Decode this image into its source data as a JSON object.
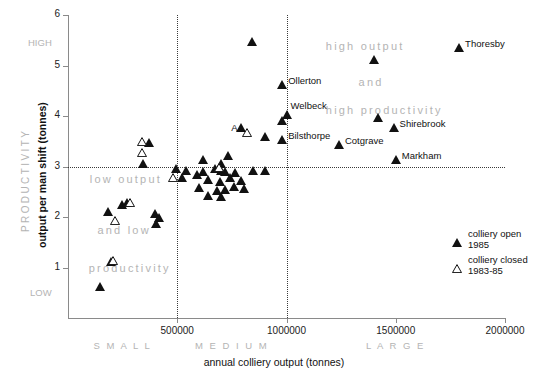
{
  "chart_data": {
    "type": "scatter",
    "title": "",
    "xlabel": "annual colliery output (tonnes)",
    "ylabel": "output per man shift (tonnes)",
    "y_supertitle": "PRODUCTIVITY",
    "xlim": [
      0,
      2000000
    ],
    "ylim": [
      0,
      6
    ],
    "xticks": [
      "500000",
      "1000000",
      "1500000",
      "2000000"
    ],
    "xtick_values": [
      500000,
      1000000,
      1500000,
      2000000
    ],
    "yticks": [
      "1",
      "2",
      "3",
      "4",
      "5",
      "6"
    ],
    "ytick_values": [
      1,
      2,
      3,
      4,
      5,
      6
    ],
    "grid": false,
    "reference_lines": {
      "vertical": [
        500000,
        1000000
      ],
      "horizontal": [
        3.0
      ],
      "style": "dotted"
    },
    "axis_extremes": {
      "y_high": "HIGH",
      "y_low": "LOW"
    },
    "size_bands": [
      {
        "label": "S M A L L",
        "from": 0,
        "to": 500000
      },
      {
        "label": "M E D I U M",
        "from": 500000,
        "to": 1000000
      },
      {
        "label": "L  A  R  G  E",
        "from": 1000000,
        "to": 2000000
      }
    ],
    "annotations": [
      {
        "text": "high output",
        "x": 1180000,
        "y": 5.35
      },
      {
        "text": "and",
        "x": 1330000,
        "y": 4.63
      },
      {
        "text": "high productivity",
        "x": 1180000,
        "y": 4.08
      },
      {
        "text": "low output",
        "x": 100000,
        "y": 2.72
      },
      {
        "text": "and low",
        "x": 135000,
        "y": 1.71
      },
      {
        "text": "productivity",
        "x": 95000,
        "y": 0.96
      }
    ],
    "legend": {
      "position": "right",
      "entries": [
        {
          "marker": "filled-triangle",
          "line1": "colliery open",
          "line2": "1985"
        },
        {
          "marker": "hollow-triangle",
          "line1": "colliery closed",
          "line2": "1983-85"
        }
      ]
    },
    "series": [
      {
        "name": "colliery open 1985",
        "marker": "filled-triangle",
        "color": "#111111",
        "points": [
          {
            "x": 1790000,
            "y": 5.35,
            "label": "Thoresby",
            "label_pos": "right"
          },
          {
            "x": 840000,
            "y": 5.47,
            "label": ""
          },
          {
            "x": 1400000,
            "y": 5.1,
            "label": ""
          },
          {
            "x": 980000,
            "y": 4.62,
            "label": "Ollerton",
            "label_pos": "right"
          },
          {
            "x": 1000000,
            "y": 4.02,
            "label": "Welbeck",
            "label_pos": "right-up"
          },
          {
            "x": 1420000,
            "y": 3.97,
            "label": ""
          },
          {
            "x": 980000,
            "y": 3.9,
            "label": ""
          },
          {
            "x": 790000,
            "y": 3.76,
            "label": ""
          },
          {
            "x": 980000,
            "y": 3.53,
            "label": "Bilsthorpe",
            "label_pos": "right"
          },
          {
            "x": 900000,
            "y": 3.58,
            "label": ""
          },
          {
            "x": 1490000,
            "y": 3.77,
            "label": "Shirebrook",
            "label_pos": "right"
          },
          {
            "x": 1240000,
            "y": 3.43,
            "label": "Cotgrave",
            "label_pos": "right"
          },
          {
            "x": 1500000,
            "y": 3.13,
            "label": "Markham",
            "label_pos": "right"
          },
          {
            "x": 370000,
            "y": 3.46,
            "label": ""
          },
          {
            "x": 345000,
            "y": 3.04,
            "label": ""
          },
          {
            "x": 620000,
            "y": 3.13,
            "label": ""
          },
          {
            "x": 730000,
            "y": 3.21,
            "label": ""
          },
          {
            "x": 700000,
            "y": 3.04,
            "label": ""
          },
          {
            "x": 540000,
            "y": 2.92,
            "label": ""
          },
          {
            "x": 620000,
            "y": 2.9,
            "label": ""
          },
          {
            "x": 675000,
            "y": 2.96,
            "label": ""
          },
          {
            "x": 700000,
            "y": 2.92,
            "label": ""
          },
          {
            "x": 720000,
            "y": 2.9,
            "label": ""
          },
          {
            "x": 765000,
            "y": 2.88,
            "label": ""
          },
          {
            "x": 845000,
            "y": 2.92,
            "label": ""
          },
          {
            "x": 900000,
            "y": 2.92,
            "label": ""
          },
          {
            "x": 520000,
            "y": 2.78,
            "label": ""
          },
          {
            "x": 590000,
            "y": 2.84,
            "label": ""
          },
          {
            "x": 640000,
            "y": 2.74,
            "label": ""
          },
          {
            "x": 695000,
            "y": 2.7,
            "label": ""
          },
          {
            "x": 740000,
            "y": 2.78,
            "label": ""
          },
          {
            "x": 790000,
            "y": 2.72,
            "label": ""
          },
          {
            "x": 495000,
            "y": 2.96,
            "label": ""
          },
          {
            "x": 600000,
            "y": 2.58,
            "label": ""
          },
          {
            "x": 680000,
            "y": 2.52,
            "label": ""
          },
          {
            "x": 720000,
            "y": 2.54,
            "label": ""
          },
          {
            "x": 760000,
            "y": 2.6,
            "label": ""
          },
          {
            "x": 805000,
            "y": 2.56,
            "label": ""
          },
          {
            "x": 640000,
            "y": 2.42,
            "label": ""
          },
          {
            "x": 700000,
            "y": 2.4,
            "label": ""
          },
          {
            "x": 185000,
            "y": 2.1,
            "label": ""
          },
          {
            "x": 245000,
            "y": 2.23,
            "label": ""
          },
          {
            "x": 270000,
            "y": 2.28,
            "label": ""
          },
          {
            "x": 400000,
            "y": 2.06,
            "label": ""
          },
          {
            "x": 415000,
            "y": 1.98,
            "label": ""
          },
          {
            "x": 405000,
            "y": 1.86,
            "label": ""
          },
          {
            "x": 195000,
            "y": 1.1,
            "label": ""
          },
          {
            "x": 145000,
            "y": 0.62,
            "label": ""
          }
        ]
      },
      {
        "name": "colliery closed 1983-85",
        "marker": "hollow-triangle",
        "color": "#111111",
        "points": [
          {
            "x": 340000,
            "y": 3.48,
            "label": ""
          },
          {
            "x": 340000,
            "y": 3.26,
            "label": ""
          },
          {
            "x": 820000,
            "y": 3.66,
            "label": "A",
            "label_pos": "left"
          },
          {
            "x": 690000,
            "y": 2.98,
            "label": ""
          },
          {
            "x": 480000,
            "y": 2.78,
            "label": ""
          },
          {
            "x": 285000,
            "y": 2.27,
            "label": ""
          },
          {
            "x": 215000,
            "y": 1.92,
            "label": ""
          },
          {
            "x": 205000,
            "y": 1.13,
            "label": ""
          }
        ]
      }
    ]
  }
}
